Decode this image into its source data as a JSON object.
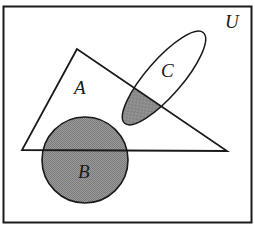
{
  "diagram": {
    "type": "venn",
    "universe": {
      "label": "U",
      "x": 3,
      "y": 6,
      "width": 249,
      "height": 217
    },
    "sets": [
      {
        "name": "A",
        "shape": "triangle",
        "points": [
          [
            77,
            49
          ],
          [
            22,
            150
          ],
          [
            227,
            151
          ]
        ],
        "label_pos": [
          81,
          94
        ]
      },
      {
        "name": "B",
        "shape": "circle",
        "cx": 85,
        "cy": 160,
        "r": 43,
        "label_pos": [
          86,
          178
        ]
      },
      {
        "name": "C",
        "shape": "ellipse",
        "cx": 164,
        "cy": 78,
        "rx": 60,
        "ry": 18,
        "rotation": -49,
        "label_pos": [
          169,
          77
        ]
      }
    ],
    "shaded_regions": [
      "B",
      "A ∩ C"
    ],
    "colors": {
      "stroke": "#1a1a1a",
      "shade": "#8c8c8c",
      "background": "#ffffff"
    }
  },
  "labels": {
    "U": "U",
    "A": "A",
    "B": "B",
    "C": "C"
  }
}
